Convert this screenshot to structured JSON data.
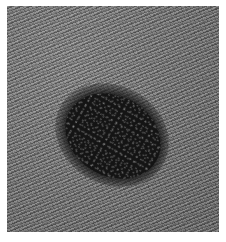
{
  "image": {
    "description": "Grayscale textured skin surface with a dark oval lesion",
    "colors": {
      "background": "#ffffff",
      "texture": "#7a7a7a",
      "lesion": "#141414"
    }
  }
}
